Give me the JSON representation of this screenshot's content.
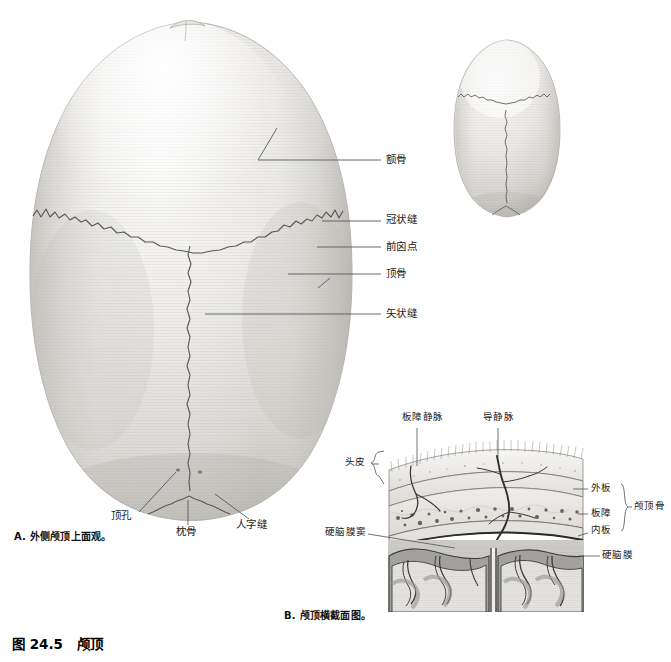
{
  "figure": {
    "number": "图 24.5",
    "title": "颅顶"
  },
  "panels": [
    {
      "id": "A",
      "caption": "A. 外侧颅顶上面观。",
      "view": "superior view of the calvaria",
      "labels": [
        {
          "name": "frontal-bone",
          "text": "额骨",
          "x": 386,
          "y": 160
        },
        {
          "name": "coronal-suture",
          "text": "冠状缝",
          "x": 386,
          "y": 219
        },
        {
          "name": "bregma",
          "text": "前囟点",
          "x": 386,
          "y": 249
        },
        {
          "name": "parietal-bone",
          "text": "顶骨",
          "x": 386,
          "y": 272
        },
        {
          "name": "sagittal-suture",
          "text": "矢状缝",
          "x": 386,
          "y": 313
        },
        {
          "name": "parietal-foramen",
          "text": "顶孔",
          "x": 111,
          "y": 516
        },
        {
          "name": "occipital-bone",
          "text": "枕骨",
          "x": 176,
          "y": 531
        },
        {
          "name": "lambdoid-suture",
          "text": "人字缝",
          "x": 236,
          "y": 524
        }
      ]
    },
    {
      "id": "B",
      "caption": "B. 颅顶横截面图。",
      "view": "coronal cross-section of the calvaria",
      "labels": [
        {
          "name": "diploic-vein",
          "text": "板障静脉",
          "x": 402,
          "y": 419
        },
        {
          "name": "emissary-vein",
          "text": "导静脉",
          "x": 489,
          "y": 419
        },
        {
          "name": "scalp",
          "text": "头皮",
          "x": 348,
          "y": 463
        },
        {
          "name": "outer-table",
          "text": "外板",
          "x": 591,
          "y": 489
        },
        {
          "name": "diploe",
          "text": "板障",
          "x": 591,
          "y": 515
        },
        {
          "name": "inner-table",
          "text": "内板",
          "x": 591,
          "y": 530
        },
        {
          "name": "calvaria",
          "text": "颅顶骨",
          "x": 634,
          "y": 509
        },
        {
          "name": "dural-venous-sinus",
          "text": "硬脑膜窦",
          "x": 328,
          "y": 533
        },
        {
          "name": "dura-mater",
          "text": "硬脑膜",
          "x": 583,
          "y": 562
        }
      ]
    },
    {
      "id": "orientation",
      "caption": "",
      "view": "small orientation thumbnail of the skull cap seen from above",
      "labels": []
    }
  ],
  "colors": {
    "bone_light": "#f2f1ef",
    "bone_mid": "#dcdad6",
    "bone_shadow": "#b6b3ae",
    "suture_line": "#5b5954",
    "leader_line": "#555a5e",
    "text": "#1a1a1a",
    "brain_gray": "#9b9b9b",
    "brain_white": "#e2e1de",
    "sinus_dark": "#1c1c1c",
    "diploe_fill": "#e9e7e3",
    "page_bg": "#ffffff"
  }
}
